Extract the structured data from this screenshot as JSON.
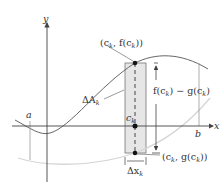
{
  "diagram": {
    "axes": {
      "x_label": "x",
      "y_label": "y"
    },
    "bounds": {
      "a_label": "a",
      "b_label": "b"
    },
    "points": {
      "top_point": "(c",
      "top_point_sub": "k",
      "top_point_mid": ", f(c",
      "top_point_end": "))",
      "bottom_point": "(c",
      "bottom_point_sub": "k",
      "bottom_point_mid": ", g(c",
      "bottom_point_end": "))",
      "ck": "c",
      "ck_sub": "k"
    },
    "annotations": {
      "delta_a": "ΔA",
      "delta_a_sub": "k",
      "delta_x": "Δx",
      "delta_x_sub": "k",
      "height_f": "f(c",
      "height_sub1": "k",
      "height_mid": ") − g(c",
      "height_sub2": "k",
      "height_end": ")"
    },
    "colors": {
      "axis": "#444444",
      "upper_curve": "#666666",
      "lower_curve": "#d6d6d6",
      "strip_fill": "#e6e6e6",
      "point": "#111111"
    }
  }
}
